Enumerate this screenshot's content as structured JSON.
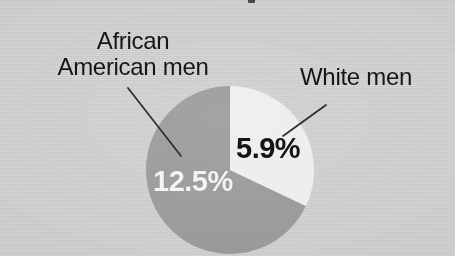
{
  "figure": {
    "background_color": "#d4d4d4",
    "media": "scanned-print"
  },
  "callouts": {
    "african_american": {
      "line1": "African",
      "line2": "American men"
    },
    "white_men": {
      "label": "White men"
    }
  },
  "chart_data": {
    "type": "pie",
    "title": "",
    "categories": [
      "White men",
      "African American men"
    ],
    "values": [
      5.9,
      12.5
    ],
    "value_labels": [
      "5.9%",
      "12.5%"
    ],
    "unit": "%",
    "colors": [
      "#ededed",
      "#999999"
    ],
    "label_text_colors": [
      "#141414",
      "#f4f4f4"
    ],
    "start_angle_deg": 0,
    "direction": "clockwise",
    "legend": "callout-labels",
    "grid": false,
    "slice_angles_deg": [
      113,
      247
    ],
    "geometry": {
      "center_x": 230,
      "center_y": 170,
      "radius": 84
    }
  }
}
